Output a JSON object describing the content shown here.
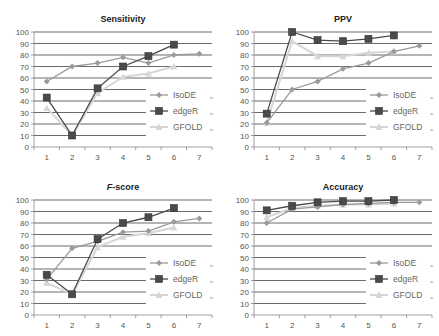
{
  "colors": {
    "IsoDE": "#9a9a9a",
    "edgeR": "#4a4a4a",
    "GFOLD": "#d6d6d6",
    "grid": "#444444",
    "axis": "#888888"
  },
  "chart_data": [
    {
      "type": "line",
      "title": "Sensitivity",
      "title_italic": false,
      "categories": [
        "1",
        "2",
        "3",
        "4",
        "5",
        "6",
        "7"
      ],
      "yticks": [
        0,
        10,
        20,
        30,
        40,
        50,
        60,
        70,
        80,
        90,
        100
      ],
      "ylim": [
        0,
        100
      ],
      "grid": true,
      "legend_position": "right-bottom",
      "series": [
        {
          "name": "IsoDE",
          "marker": "diamond",
          "values": [
            57,
            70,
            73,
            78,
            73,
            80,
            81
          ]
        },
        {
          "name": "edgeR",
          "marker": "square",
          "values": [
            43,
            10,
            51,
            70,
            79,
            89,
            null
          ]
        },
        {
          "name": "GFOLD",
          "marker": "triangle",
          "values": [
            34,
            10,
            47,
            61,
            64,
            70,
            null
          ]
        }
      ]
    },
    {
      "type": "line",
      "title": "PPV",
      "title_italic": false,
      "categories": [
        "1",
        "2",
        "3",
        "4",
        "5",
        "6",
        "7"
      ],
      "yticks": [
        0,
        10,
        20,
        30,
        40,
        50,
        60,
        70,
        80,
        90,
        100
      ],
      "ylim": [
        0,
        100
      ],
      "grid": true,
      "legend_position": "right-bottom",
      "series": [
        {
          "name": "IsoDE",
          "marker": "diamond",
          "values": [
            21,
            50,
            57,
            68,
            73,
            83,
            88
          ]
        },
        {
          "name": "edgeR",
          "marker": "square",
          "values": [
            29,
            100,
            93,
            92,
            94,
            97,
            null
          ]
        },
        {
          "name": "GFOLD",
          "marker": "triangle",
          "values": [
            21,
            92,
            79,
            79,
            82,
            83,
            null
          ]
        }
      ]
    },
    {
      "type": "line",
      "title": "F-score",
      "title_italic": true,
      "categories": [
        "1",
        "2",
        "3",
        "4",
        "5",
        "6",
        "7"
      ],
      "yticks": [
        0,
        10,
        20,
        30,
        40,
        50,
        60,
        70,
        80,
        90,
        100
      ],
      "ylim": [
        0,
        100
      ],
      "grid": true,
      "legend_position": "right-bottom",
      "series": [
        {
          "name": "IsoDE",
          "marker": "diamond",
          "values": [
            31,
            58,
            64,
            72,
            73,
            81,
            84
          ]
        },
        {
          "name": "edgeR",
          "marker": "square",
          "values": [
            35,
            18,
            66,
            80,
            85,
            93,
            null
          ]
        },
        {
          "name": "GFOLD",
          "marker": "triangle",
          "values": [
            28,
            18,
            59,
            68,
            71,
            76,
            null
          ]
        }
      ]
    },
    {
      "type": "line",
      "title": "Accuracy",
      "title_italic": false,
      "categories": [
        "1",
        "2",
        "3",
        "4",
        "5",
        "6",
        "7"
      ],
      "yticks": [
        0,
        10,
        20,
        30,
        40,
        50,
        60,
        70,
        80,
        90,
        100
      ],
      "ylim": [
        0,
        100
      ],
      "grid": true,
      "legend_position": "right-bottom",
      "series": [
        {
          "name": "IsoDE",
          "marker": "diamond",
          "values": [
            80,
            92,
            94,
            96,
            97,
            98,
            98
          ]
        },
        {
          "name": "edgeR",
          "marker": "square",
          "values": [
            91,
            95,
            98,
            99,
            99,
            100,
            null
          ]
        },
        {
          "name": "GFOLD",
          "marker": "triangle",
          "values": [
            85,
            93,
            95,
            96,
            96,
            97,
            null
          ]
        }
      ]
    }
  ]
}
